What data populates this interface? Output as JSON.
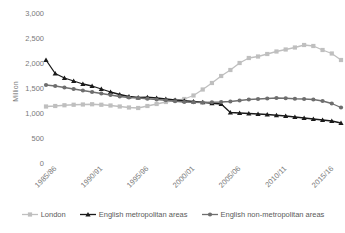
{
  "chart_data": {
    "type": "line",
    "title": "",
    "xlabel": "",
    "ylabel": "Million",
    "ylim": [
      0,
      3000
    ],
    "yticks": [
      "0",
      "500",
      "1,000",
      "1,500",
      "2,000",
      "2,500",
      "3,000"
    ],
    "ytick_values": [
      0,
      500,
      1000,
      1500,
      2000,
      2500,
      3000
    ],
    "grid": false,
    "legend_position": "bottom",
    "x": [
      "1985/86",
      "1986/87",
      "1987/88",
      "1988/89",
      "1989/90",
      "1990/91",
      "1991/92",
      "1992/93",
      "1993/94",
      "1994/95",
      "1995/96",
      "1996/97",
      "1997/98",
      "1998/99",
      "1999/00",
      "2000/01",
      "2001/02",
      "2002/03",
      "2003/04",
      "2004/05",
      "2005/06",
      "2006/07",
      "2007/08",
      "2008/09",
      "2009/10",
      "2010/11",
      "2011/12",
      "2012/13",
      "2013/14",
      "2014/15",
      "2015/16",
      "2016/17",
      "2017/18"
    ],
    "xtick_labels": [
      "1985/86",
      "1990/91",
      "1995/96",
      "2000/01",
      "2005/06",
      "2010/11",
      "2015/16"
    ],
    "xtick_indices": [
      0,
      5,
      10,
      15,
      20,
      25,
      30
    ],
    "series": [
      {
        "name": "London",
        "color": "#bfbfbf",
        "marker": "square",
        "values": [
          1150,
          1160,
          1175,
          1185,
          1190,
          1195,
          1185,
          1170,
          1150,
          1130,
          1120,
          1160,
          1200,
          1240,
          1270,
          1300,
          1370,
          1490,
          1620,
          1760,
          1880,
          2020,
          2120,
          2150,
          2200,
          2250,
          2290,
          2330,
          2380,
          2360,
          2280,
          2210,
          2080
        ]
      },
      {
        "name": "English metropolitan areas",
        "color": "#1a1a1a",
        "marker": "triangle",
        "values": [
          2080,
          1810,
          1720,
          1660,
          1600,
          1560,
          1500,
          1440,
          1390,
          1350,
          1330,
          1335,
          1320,
          1300,
          1280,
          1265,
          1250,
          1235,
          1215,
          1200,
          1030,
          1020,
          1010,
          1000,
          990,
          975,
          960,
          940,
          920,
          900,
          880,
          860,
          820
        ]
      },
      {
        "name": "English non-metropolitan areas",
        "color": "#6e6e6e",
        "marker": "circle",
        "values": [
          1580,
          1560,
          1530,
          1500,
          1470,
          1440,
          1410,
          1380,
          1350,
          1330,
          1320,
          1305,
          1290,
          1275,
          1255,
          1240,
          1235,
          1230,
          1235,
          1240,
          1250,
          1270,
          1290,
          1300,
          1310,
          1320,
          1315,
          1305,
          1300,
          1290,
          1260,
          1210,
          1130
        ]
      }
    ]
  },
  "legend": {
    "items": [
      {
        "label": "London"
      },
      {
        "label": "English metropolitan areas"
      },
      {
        "label": "English non-metropolitan areas"
      }
    ]
  }
}
